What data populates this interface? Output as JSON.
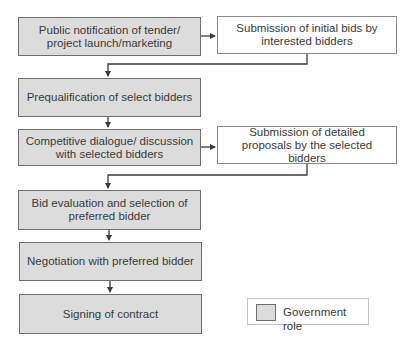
{
  "diagram": {
    "type": "flowchart",
    "steps": [
      {
        "id": "s1",
        "label": "Public notification of tender/ project launch/marketing",
        "lines": [
          "Public notification of tender/",
          "project launch/marketing"
        ],
        "role": "government"
      },
      {
        "id": "s2",
        "label": "Submission of initial bids by interested bidders",
        "lines": [
          "Submission of initial bids by",
          "interested bidders"
        ],
        "role": "bidder"
      },
      {
        "id": "s3",
        "label": "Prequalification of select bidders",
        "lines": [
          "Prequalification of select bidders"
        ],
        "role": "government"
      },
      {
        "id": "s4",
        "label": "Competitive dialogue/ discussion with selected bidders",
        "lines": [
          "Competitive dialogue/",
          "discussion with selected bidders"
        ],
        "role": "government"
      },
      {
        "id": "s5",
        "label": "Submission of detailed proposals by the selected bidders",
        "lines": [
          "Submission of detailed proposals",
          "by the selected bidders"
        ],
        "role": "bidder"
      },
      {
        "id": "s6",
        "label": "Bid evaluation and selection of preferred bidder",
        "lines": [
          "Bid evaluation and selection of",
          "preferred bidder"
        ],
        "role": "government"
      },
      {
        "id": "s7",
        "label": "Negotiation with preferred bidder",
        "lines": [
          "Negotiation with preferred",
          "bidder"
        ],
        "role": "government"
      },
      {
        "id": "s8",
        "label": "Signing of contract",
        "lines": [
          "Signing of contract"
        ],
        "role": "government"
      }
    ],
    "edges": [
      {
        "from": "s1",
        "to": "s2"
      },
      {
        "from": "s2",
        "to": "s3"
      },
      {
        "from": "s3",
        "to": "s4"
      },
      {
        "from": "s4",
        "to": "s5"
      },
      {
        "from": "s5",
        "to": "s6"
      },
      {
        "from": "s6",
        "to": "s7"
      },
      {
        "from": "s7",
        "to": "s8"
      }
    ],
    "legend": {
      "items": [
        {
          "label": "Government role",
          "color": "#dcdcdc"
        }
      ]
    },
    "colors": {
      "government_fill": "#dcdcdc",
      "other_fill": "#ffffff",
      "border": "#6e6e6e",
      "connector": "#3a3a3a"
    }
  }
}
